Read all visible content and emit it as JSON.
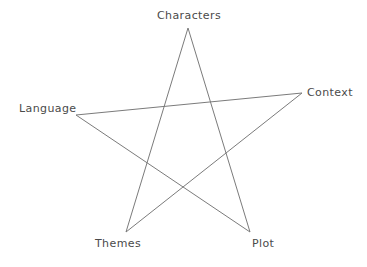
{
  "diagram": {
    "type": "pentagram-star-diagram",
    "background_color": "#ffffff",
    "line_color": "#7b7b7b",
    "label_color": "#4a4a4a",
    "nodes": [
      {
        "id": "characters",
        "label": "Characters",
        "x": 188,
        "y": 28,
        "position": "top"
      },
      {
        "id": "context",
        "label": "Context",
        "x": 302,
        "y": 93,
        "position": "right"
      },
      {
        "id": "plot",
        "label": "Plot",
        "x": 250,
        "y": 232,
        "position": "bottom-right"
      },
      {
        "id": "themes",
        "label": "Themes",
        "x": 126,
        "y": 232,
        "position": "bottom-left"
      },
      {
        "id": "language",
        "label": "Language",
        "x": 76,
        "y": 115,
        "position": "left"
      }
    ],
    "edges": [
      {
        "from": "characters",
        "to": "plot"
      },
      {
        "from": "plot",
        "to": "language"
      },
      {
        "from": "language",
        "to": "context"
      },
      {
        "from": "context",
        "to": "themes"
      },
      {
        "from": "themes",
        "to": "characters"
      }
    ],
    "path_points": "188,28 250,232 76,115 302,93 126,232 188,28"
  }
}
